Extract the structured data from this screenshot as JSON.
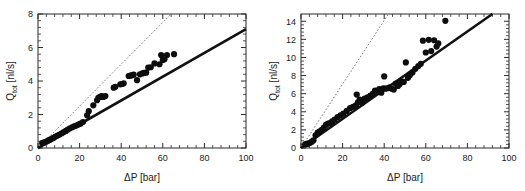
{
  "figure": {
    "background_color": "#ffffff",
    "panel_count": 2
  },
  "chart_data": [
    {
      "type": "scatter",
      "panel": "left",
      "title": "",
      "xlabel": "ΔP [bar]",
      "ylabel": "Q_tot [nl/s]",
      "ylabel_display": "Q",
      "ylabel_subscript": "tot",
      "ylabel_units": " [nl/s]",
      "xlim": [
        0,
        100
      ],
      "ylim": [
        0,
        8
      ],
      "xticks": [
        0,
        20,
        40,
        60,
        80,
        100
      ],
      "yticks": [
        0,
        2,
        4,
        6,
        8
      ],
      "xtick_labels": [
        "0",
        "20",
        "40",
        "60",
        "80",
        "100"
      ],
      "ytick_labels": [
        "0",
        "2",
        "4",
        "6",
        "8"
      ],
      "x_minor_per_interval": 4,
      "y_minor_per_interval": 4,
      "grid": false,
      "legend": false,
      "marker_style": "filled-circle",
      "marker_color": "#0d0d0d",
      "marker_radius": 3.1,
      "series": [
        {
          "name": "measured flow rate",
          "x": [
            2.0,
            2.6,
            3.4,
            4.2,
            5.0,
            5.8,
            6.6,
            7.4,
            8.4,
            9.4,
            10.4,
            11.4,
            12.4,
            13.4,
            14.4,
            15.4,
            16.4,
            17.4,
            18.4,
            19.4,
            20.4,
            21.6,
            23.6,
            24.4,
            26.6,
            28.4,
            29.0,
            29.8,
            30.6,
            31.4,
            32.4,
            36.4,
            37.2,
            39.6,
            40.4,
            41.2,
            43.6,
            44.4,
            45.2,
            46.0,
            47.6,
            49.0,
            50.2,
            51.0,
            52.0,
            53.0,
            54.2,
            56.0,
            58.4,
            59.2,
            60.0,
            60.8,
            62.0,
            65.4
          ],
          "y": [
            0.3,
            0.32,
            0.35,
            0.4,
            0.45,
            0.5,
            0.55,
            0.6,
            0.68,
            0.74,
            0.8,
            0.88,
            0.95,
            1.02,
            1.1,
            1.18,
            1.24,
            1.3,
            1.34,
            1.4,
            1.45,
            1.55,
            1.95,
            2.2,
            2.55,
            2.85,
            3.0,
            3.05,
            3.1,
            3.05,
            3.1,
            3.6,
            3.65,
            3.8,
            3.82,
            3.86,
            4.3,
            4.32,
            4.35,
            4.38,
            4.05,
            4.4,
            4.45,
            4.48,
            4.5,
            4.8,
            4.82,
            5.05,
            5.0,
            5.55,
            5.25,
            5.3,
            5.55,
            5.6
          ]
        }
      ],
      "lines": [
        {
          "name": "model-fit",
          "style": "solid",
          "color": "#111111",
          "width": 2.6,
          "x": [
            0,
            100
          ],
          "y": [
            0.0,
            7.1
          ],
          "slope": 0.071,
          "intercept": 0.0
        },
        {
          "name": "ideal-reference",
          "style": "dotted",
          "color": "#7a7a7a",
          "width": 1.0,
          "x": [
            0,
            64
          ],
          "y": [
            0.0,
            8.0
          ],
          "slope": 0.125,
          "intercept": 0.0
        }
      ]
    },
    {
      "type": "scatter",
      "panel": "right",
      "title": "",
      "xlabel": "ΔP [bar]",
      "ylabel": "Q_tot [nl/s]",
      "ylabel_display": "Q",
      "ylabel_subscript": "tot",
      "ylabel_units": " [nl/s]",
      "xlim": [
        0,
        100
      ],
      "ylim": [
        0,
        14.8
      ],
      "xticks": [
        0,
        20,
        40,
        60,
        80,
        100
      ],
      "yticks": [
        0,
        2,
        4,
        6,
        8,
        10,
        12,
        14
      ],
      "xtick_labels": [
        "0",
        "20",
        "40",
        "60",
        "80",
        "100"
      ],
      "ytick_labels": [
        "0",
        "2",
        "4",
        "6",
        "8",
        "10",
        "12",
        "14"
      ],
      "x_minor_per_interval": 4,
      "y_minor_per_interval": 4,
      "grid": false,
      "legend": false,
      "marker_style": "filled-circle",
      "marker_color": "#0d0d0d",
      "marker_radius": 3.1,
      "series": [
        {
          "name": "measured flow rate",
          "x": [
            2.0,
            2.8,
            3.6,
            4.4,
            5.2,
            6.0,
            7.0,
            8.0,
            9.0,
            10.0,
            11.0,
            12.0,
            13.0,
            14.0,
            15.0,
            16.2,
            17.6,
            19.0,
            20.4,
            22.0,
            23.6,
            25.0,
            26.4,
            26.8,
            27.4,
            28.2,
            29.4,
            30.6,
            32.0,
            33.4,
            34.6,
            35.6,
            36.6,
            37.6,
            38.6,
            39.6,
            40.0,
            40.6,
            41.6,
            42.6,
            43.6,
            44.6,
            45.6,
            46.6,
            47.4,
            48.4,
            49.4,
            50.4,
            51.4,
            52.4,
            53.6,
            55.0,
            56.4,
            57.6,
            58.6,
            60.0,
            61.4,
            62.6,
            64.0,
            65.2,
            66.0,
            69.4
          ],
          "y": [
            0.4,
            0.45,
            0.5,
            0.58,
            0.7,
            0.85,
            1.4,
            1.7,
            1.85,
            2.0,
            2.25,
            2.55,
            2.7,
            2.75,
            2.95,
            3.15,
            3.4,
            3.6,
            3.8,
            4.1,
            4.4,
            4.55,
            4.7,
            5.9,
            5.05,
            5.35,
            5.0,
            5.45,
            5.6,
            5.8,
            6.0,
            6.35,
            6.25,
            6.5,
            6.1,
            6.6,
            7.9,
            6.55,
            6.6,
            6.7,
            6.55,
            6.45,
            7.1,
            6.85,
            7.05,
            7.35,
            7.3,
            9.45,
            7.75,
            8.05,
            8.35,
            8.75,
            9.05,
            9.3,
            11.85,
            10.55,
            11.95,
            10.7,
            11.9,
            11.2,
            11.55,
            14.05
          ]
        }
      ],
      "lines": [
        {
          "name": "model-fit",
          "style": "solid",
          "color": "#111111",
          "width": 2.6,
          "x": [
            0,
            92
          ],
          "y": [
            0.0,
            14.8
          ],
          "slope": 0.1609,
          "intercept": 0.0
        },
        {
          "name": "ideal-reference",
          "style": "dotted",
          "color": "#7a7a7a",
          "width": 1.0,
          "x": [
            0,
            42
          ],
          "y": [
            0.0,
            14.8
          ],
          "slope": 0.3524,
          "intercept": 0.0
        }
      ]
    }
  ]
}
